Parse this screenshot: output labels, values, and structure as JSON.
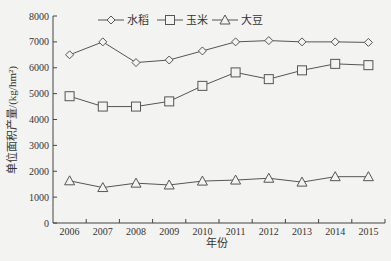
{
  "chart_data": {
    "type": "line",
    "title": "",
    "xlabel": "年份",
    "ylabel": "单位面积产量/(kg/hm²)",
    "ylim": [
      0,
      8000
    ],
    "yticks": [
      0,
      1000,
      2000,
      3000,
      4000,
      5000,
      6000,
      7000,
      8000
    ],
    "categories": [
      "2006",
      "2007",
      "2008",
      "2009",
      "2010",
      "2011",
      "2012",
      "2013",
      "2014",
      "2015"
    ],
    "grid": false,
    "legend_position": "top",
    "series": [
      {
        "name": "水稻",
        "marker": "diamond",
        "values": [
          6500,
          7000,
          6200,
          6300,
          6650,
          7000,
          7050,
          7000,
          7000,
          6980
        ]
      },
      {
        "name": "玉米",
        "marker": "square",
        "values": [
          4900,
          4500,
          4500,
          4700,
          5300,
          5820,
          5560,
          5900,
          6150,
          6100
        ]
      },
      {
        "name": "大豆",
        "marker": "triangle",
        "values": [
          1630,
          1370,
          1540,
          1470,
          1620,
          1660,
          1730,
          1580,
          1790,
          1790
        ]
      }
    ]
  },
  "colors": {
    "line": "#555555",
    "axis": "#444444",
    "background": "#f3f3f1"
  }
}
